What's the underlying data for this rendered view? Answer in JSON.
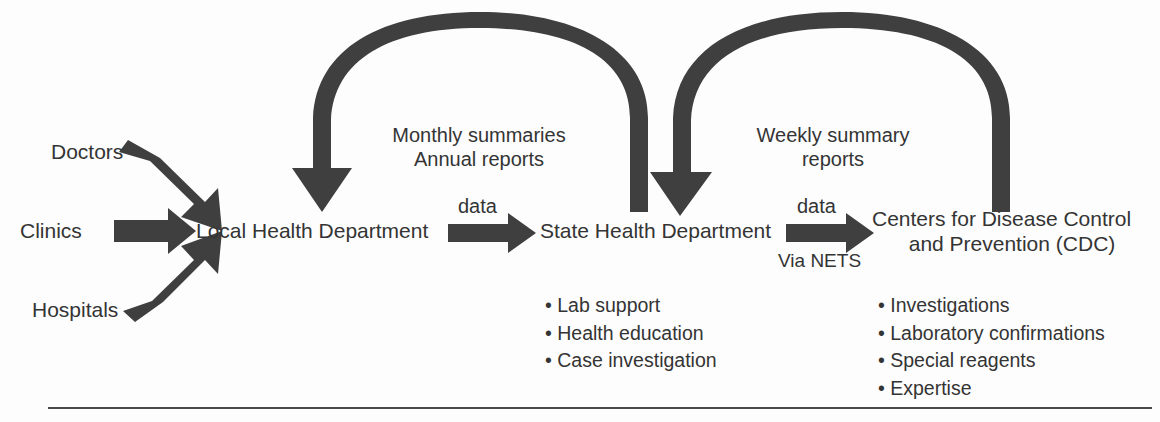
{
  "diagram": {
    "colors": {
      "arrow": "#3f3f3f",
      "text": "#343434",
      "background": "#fdfdfd",
      "rule": "#4a4a4a"
    },
    "sources": [
      {
        "label": "Doctors"
      },
      {
        "label": "Clinics"
      },
      {
        "label": "Hospitals"
      }
    ],
    "nodes": [
      {
        "id": "local",
        "label": "Local Health Department"
      },
      {
        "id": "state",
        "label": "State Health Department"
      },
      {
        "id": "cdc",
        "line1": "Centers for Disease Control",
        "line2": "and Prevention (CDC)"
      }
    ],
    "flows": [
      {
        "id": "local-to-state",
        "label": "data",
        "sublabel": ""
      },
      {
        "id": "state-to-cdc",
        "label": "data",
        "sublabel": "Via NETS"
      }
    ],
    "feedback": [
      {
        "id": "state-to-local",
        "line1": "Monthly summaries",
        "line2": "Annual reports"
      },
      {
        "id": "cdc-to-state",
        "line1": "Weekly summary",
        "line2": "reports"
      }
    ],
    "services": [
      {
        "id": "state-services",
        "items": [
          "Lab support",
          "Health education",
          "Case investigation"
        ]
      },
      {
        "id": "cdc-services",
        "items": [
          "Investigations",
          "Laboratory confirmations",
          "Special reagents",
          "Expertise"
        ]
      }
    ],
    "bullet_glyph": "•"
  }
}
